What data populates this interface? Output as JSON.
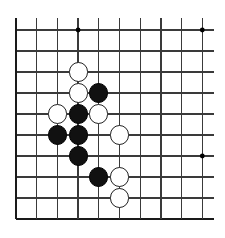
{
  "diagram": {
    "kind": "go-board-diagram",
    "board": {
      "line_color": "#3a3a3a",
      "edge_color": "#1a1a1a",
      "background_color": "#ffffff",
      "star_point_color": "#000000",
      "origin_x": 16,
      "origin_y": 30,
      "col_spacing": 20.7,
      "row_spacing": 21.0,
      "cols": 10,
      "rows": 10,
      "stone_radius": 9.6,
      "overhang_top": 12,
      "overhang_right": 12,
      "edges": {
        "left": "heavy",
        "bottom": "heavy",
        "top": "open",
        "right": "open"
      }
    },
    "star_points": [
      {
        "col": 3,
        "row": 0
      },
      {
        "col": 9,
        "row": 0
      },
      {
        "col": 9,
        "row": 6
      }
    ],
    "stones": [
      {
        "color": "white",
        "col": 3,
        "row": 2
      },
      {
        "color": "white",
        "col": 3,
        "row": 3
      },
      {
        "color": "black",
        "col": 4,
        "row": 3
      },
      {
        "color": "white",
        "col": 2,
        "row": 4
      },
      {
        "color": "black",
        "col": 3,
        "row": 4
      },
      {
        "color": "white",
        "col": 4,
        "row": 4
      },
      {
        "color": "black",
        "col": 2,
        "row": 5
      },
      {
        "color": "black",
        "col": 3,
        "row": 5
      },
      {
        "color": "white",
        "col": 5,
        "row": 5
      },
      {
        "color": "black",
        "col": 3,
        "row": 6
      },
      {
        "color": "black",
        "col": 4,
        "row": 7
      },
      {
        "color": "white",
        "col": 5,
        "row": 7
      },
      {
        "color": "white",
        "col": 5,
        "row": 8
      }
    ],
    "counts": {
      "black_stones": 7,
      "white_stones": 6,
      "total_stones": 13
    }
  }
}
